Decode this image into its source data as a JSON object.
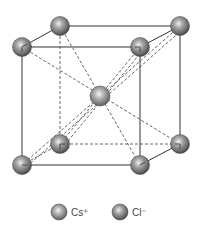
{
  "diagram": {
    "type": "body-centered cubic crystal structure",
    "colors": {
      "background": "#ffffff",
      "edge": "#333333",
      "dashed": "#555555",
      "sphere_dark": "#4a4a4a",
      "sphere_mid": "#8a8a8a",
      "sphere_light": "#e8e8e8"
    },
    "atoms": [
      {
        "id": "corner-back-top-left",
        "ion": "Cl-",
        "x": 60,
        "y": 26
      },
      {
        "id": "corner-back-top-right",
        "ion": "Cl-",
        "x": 180,
        "y": 26
      },
      {
        "id": "corner-front-top-left",
        "ion": "Cl-",
        "x": 22,
        "y": 47
      },
      {
        "id": "corner-front-top-right",
        "ion": "Cl-",
        "x": 140,
        "y": 47
      },
      {
        "id": "body-center",
        "ion": "Cs+",
        "x": 100,
        "y": 96
      },
      {
        "id": "corner-back-bottom-left",
        "ion": "Cl-",
        "x": 60,
        "y": 144
      },
      {
        "id": "corner-back-bottom-right",
        "ion": "Cl-",
        "x": 180,
        "y": 144
      },
      {
        "id": "corner-front-bottom-left",
        "ion": "Cl-",
        "x": 22,
        "y": 165
      },
      {
        "id": "corner-front-bottom-right",
        "ion": "Cl-",
        "x": 140,
        "y": 165
      }
    ]
  },
  "legend": {
    "items": [
      {
        "label": "Cs⁺",
        "ion": "Cs+"
      },
      {
        "label": "Cl⁻",
        "ion": "Cl-"
      }
    ]
  }
}
